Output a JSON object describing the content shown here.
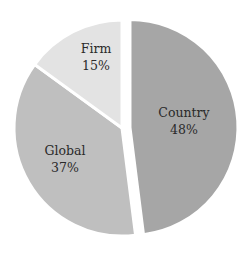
{
  "chart_data": {
    "type": "pie",
    "title": "",
    "categories": [
      "Country",
      "Global",
      "Firm"
    ],
    "values": [
      48,
      37,
      15
    ],
    "labels": [
      "48%",
      "37%",
      "15%"
    ],
    "colors": [
      "#a6a6a6",
      "#bfbfbf",
      "#e3e3e3"
    ],
    "exploded": [
      "Country"
    ],
    "legend": "none",
    "data_labels": "inside (category name + percentage)"
  },
  "slices": [
    {
      "name": "Country",
      "pct": "48%",
      "color": "#a6a6a6"
    },
    {
      "name": "Global",
      "pct": "37%",
      "color": "#bfbfbf"
    },
    {
      "name": "Firm",
      "pct": "15%",
      "color": "#e3e3e3"
    }
  ]
}
